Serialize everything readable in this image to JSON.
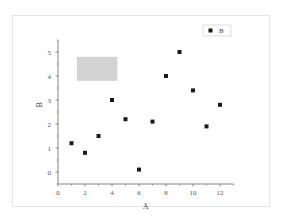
{
  "chart_data": {
    "type": "scatter",
    "title": "",
    "xlabel": "A",
    "ylabel": "B",
    "xlim": [
      0,
      13
    ],
    "ylim": [
      -0.5,
      5.5
    ],
    "x_ticks": [
      0,
      2,
      4,
      6,
      8,
      10,
      12
    ],
    "y_ticks": [
      0,
      1,
      2,
      3,
      4,
      5
    ],
    "grid": false,
    "legend_position": "top-right",
    "series": [
      {
        "name": "B",
        "marker": "square",
        "color": "#1a1a1a",
        "x": [
          1,
          2,
          3,
          4,
          5,
          6,
          7,
          8,
          9,
          10,
          11,
          12
        ],
        "y": [
          1.2,
          0.8,
          1.5,
          3.0,
          2.2,
          0.1,
          2.1,
          4.0,
          5.0,
          3.4,
          1.9,
          2.8
        ]
      }
    ],
    "annotations": [
      {
        "type": "rectangle",
        "x0": 1.4,
        "x1": 4.4,
        "y0": 3.8,
        "y1": 4.8,
        "color": "#d3d3d3"
      }
    ]
  },
  "legend": {
    "label": "B"
  },
  "colors": {
    "marker": "#1a1a1a",
    "axis": "#666666",
    "highlight": "#d3d3d3"
  }
}
